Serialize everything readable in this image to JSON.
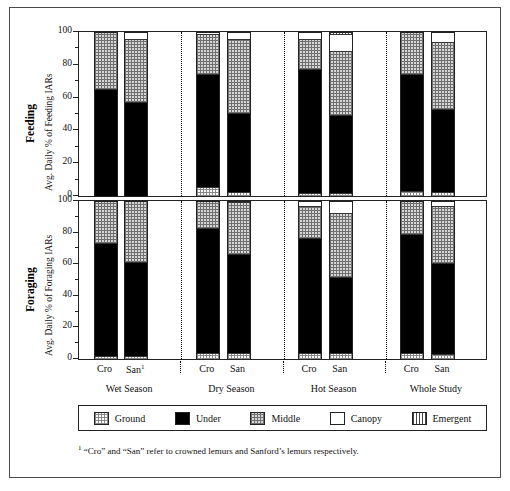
{
  "chart_data": {
    "type": "bar",
    "subtype": "stacked-bar",
    "orientation": "vertical",
    "stacked": true,
    "stack_total": 100,
    "panels": [
      {
        "id": "feeding",
        "title": "Feeding",
        "ylabel": "Avg. Daily % of Feeding IARs",
        "ylim": [
          0,
          100
        ],
        "yticks": [
          0,
          20,
          40,
          60,
          80,
          100
        ],
        "ytick_labels": [
          "0",
          "20",
          "40",
          "60",
          "80",
          "100"
        ],
        "grid": false,
        "categories": [
          "Wet Season Cro",
          "Wet Season San",
          "Dry Season Cro",
          "Dry Season San",
          "Hot Season Cro",
          "Hot Season San",
          "Whole Study Cro",
          "Whole Study San"
        ],
        "series": [
          {
            "name": "Ground",
            "values": [
              0,
              0,
              5,
              2,
              1.5,
              1,
              2.5,
              2
            ]
          },
          {
            "name": "Under",
            "values": [
              65,
              57,
              69.5,
              48.5,
              76,
              48.5,
              71.5,
              50.5
            ]
          },
          {
            "name": "Middle",
            "values": [
              35,
              38.5,
              24.5,
              45.5,
              18.5,
              39.5,
              26,
              41.5
            ]
          },
          {
            "name": "Canopy",
            "values": [
              0,
              4.5,
              1,
              4,
              4,
              11,
              0,
              6
            ]
          },
          {
            "name": "Emergent",
            "values": [
              0,
              0,
              0,
              0,
              0,
              1,
              0,
              0
            ]
          }
        ]
      },
      {
        "id": "foraging",
        "title": "Foraging",
        "ylabel": "Avg. Daily % of Foraging IARs",
        "ylim": [
          0,
          100
        ],
        "yticks": [
          0,
          20,
          40,
          60,
          80,
          100
        ],
        "ytick_labels": [
          "0",
          "20",
          "40",
          "60",
          "80",
          "100"
        ],
        "grid": false,
        "categories": [
          "Wet Season Cro",
          "Wet Season San",
          "Dry Season Cro",
          "Dry Season San",
          "Hot Season Cro",
          "Hot Season San",
          "Whole Study Cro",
          "Whole Study San"
        ],
        "series": [
          {
            "name": "Ground",
            "values": [
              1.5,
              1.5,
              3.5,
              3.5,
              3,
              3,
              3,
              2.5
            ]
          },
          {
            "name": "Under",
            "values": [
              72,
              59.5,
              79,
              63,
              73.5,
              48.5,
              76,
              58
            ]
          },
          {
            "name": "Middle",
            "values": [
              26.5,
              39,
              17.5,
              33,
              20.5,
              41,
              21,
              36.5
            ]
          },
          {
            "name": "Canopy",
            "values": [
              0,
              0,
              0,
              0.5,
              3,
              7.5,
              0,
              3
            ]
          },
          {
            "name": "Emergent",
            "values": [
              0,
              0,
              0,
              0,
              0,
              0,
              0,
              0
            ]
          }
        ]
      }
    ],
    "groups": [
      {
        "label": "Wet Season",
        "bars": [
          "Cro",
          "San"
        ],
        "san_footnote": true
      },
      {
        "label": "Dry Season",
        "bars": [
          "Cro",
          "San"
        ],
        "san_footnote": false
      },
      {
        "label": "Hot Season",
        "bars": [
          "Cro",
          "San"
        ],
        "san_footnote": false
      },
      {
        "label": "Whole Study",
        "bars": [
          "Cro",
          "San"
        ],
        "san_footnote": false
      }
    ],
    "legend": {
      "position": "bottom",
      "entries": [
        {
          "label": "Ground",
          "pattern": "fine-grid",
          "color": "#ffffff"
        },
        {
          "label": "Under",
          "pattern": "solid",
          "color": "#000000"
        },
        {
          "label": "Middle",
          "pattern": "coarse-stipple",
          "color": "#d6d6d6"
        },
        {
          "label": "Canopy",
          "pattern": "empty",
          "color": "#ffffff"
        },
        {
          "label": "Emergent",
          "pattern": "vertical-lines",
          "color": "#ffffff"
        }
      ]
    },
    "footnote": {
      "marker": "1",
      "text": "“Cro” and “San” refer to crowned lemurs and Sanford’s lemurs respectively."
    }
  },
  "labels": {
    "bar_cro": "Cro",
    "bar_san": "San",
    "san_sup": "1"
  }
}
